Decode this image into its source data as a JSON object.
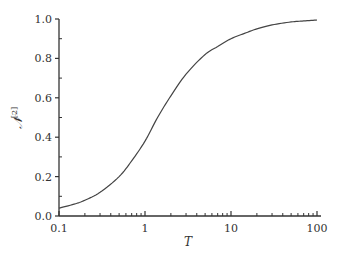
{
  "chart_data": {
    "type": "line",
    "title": "",
    "xlabel": "T",
    "ylabel": "N^[2]",
    "ylabel_main": "𝒩",
    "ylabel_sup": "[2]",
    "xscale": "log",
    "xlim": [
      0.1,
      100
    ],
    "ylim": [
      0.0,
      1.0
    ],
    "xticks": [
      0.1,
      1,
      10,
      100
    ],
    "xtick_labels": [
      "0.1",
      "1",
      "10",
      "100"
    ],
    "yticks": [
      0.0,
      0.2,
      0.4,
      0.6,
      0.8,
      1.0
    ],
    "ytick_labels": [
      "0.0",
      "0.2",
      "0.4",
      "0.6",
      "0.8",
      "1.0"
    ],
    "grid": false,
    "legend": null,
    "series": [
      {
        "name": "N^[2](T)",
        "color": "#444444",
        "x": [
          0.1,
          0.15,
          0.2,
          0.3,
          0.5,
          0.7,
          1.0,
          1.4,
          2.0,
          3.0,
          5.0,
          7.0,
          10,
          15,
          20,
          30,
          50,
          70,
          100
        ],
        "y": [
          0.04,
          0.06,
          0.08,
          0.12,
          0.2,
          0.28,
          0.38,
          0.5,
          0.61,
          0.72,
          0.82,
          0.86,
          0.9,
          0.93,
          0.95,
          0.97,
          0.985,
          0.99,
          0.995
        ]
      }
    ]
  }
}
